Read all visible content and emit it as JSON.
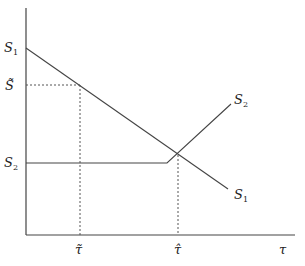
{
  "diagram": {
    "type": "economic-curves",
    "axes": {
      "x_label": "τ",
      "y_label": ""
    },
    "curves": [
      {
        "name": "S1",
        "label_main": "S",
        "label_sub": "1",
        "shape": "downward-sloping line"
      },
      {
        "name": "S2",
        "label_main": "S",
        "label_sub": "2",
        "shape": "horizontal then upward-sloping"
      }
    ],
    "y_ticks": [
      {
        "id": "s1-intercept",
        "main": "S",
        "sub": "1"
      },
      {
        "id": "s-tilde",
        "main": "S̃",
        "sub": ""
      },
      {
        "id": "s2-level",
        "main": "S",
        "sub": "2"
      }
    ],
    "x_ticks": [
      {
        "id": "tau-tilde",
        "label": "τ̃"
      },
      {
        "id": "tau-hat",
        "label": "τ̂"
      },
      {
        "id": "tau",
        "label": "τ"
      }
    ],
    "colors": {
      "line": "#444444",
      "guide": "#555555"
    }
  }
}
